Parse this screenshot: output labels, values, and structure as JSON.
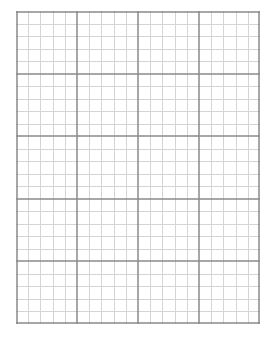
{
  "page": {
    "type": "graph-paper",
    "background": "#ffffff"
  },
  "grid": {
    "left": 16,
    "top": 11,
    "width": 244,
    "height": 313,
    "major_columns": 4,
    "major_rows": 5,
    "minor_per_major": 5,
    "major_color": "#8a8a8a",
    "minor_color": "#d4d4d4",
    "border_color": "#8a8a8a"
  }
}
